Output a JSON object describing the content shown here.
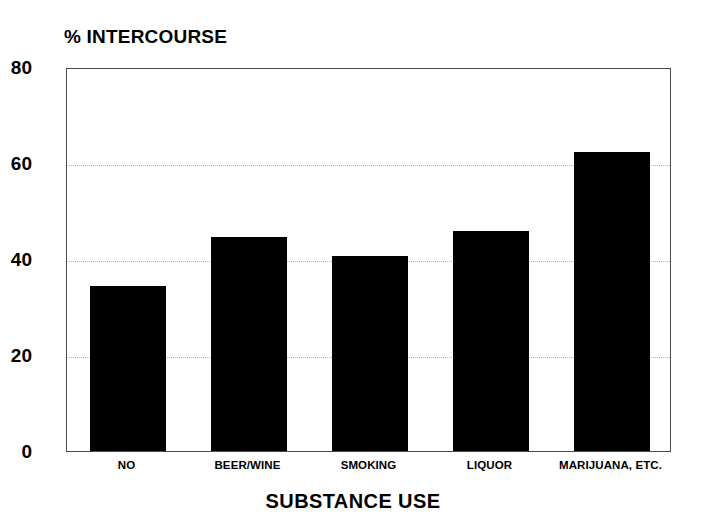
{
  "chart_data": {
    "type": "bar",
    "title": "",
    "ylabel": "% INTERCOURSE",
    "xlabel": "SUBSTANCE USE",
    "categories": [
      "NO",
      "BEER/WINE",
      "SMOKING",
      "LIQUOR",
      "MARIJUANA, ETC."
    ],
    "values": [
      34.4,
      44.6,
      40.7,
      45.8,
      62.2
    ],
    "ylim": [
      0,
      80
    ],
    "yticks": [
      0,
      20,
      40,
      60,
      80
    ],
    "ytick_labels": [
      "0",
      "20",
      "40",
      "60",
      "80"
    ],
    "grid": "horizontal-dotted",
    "gridlines_at": [
      20,
      40,
      60
    ],
    "legend": "none",
    "bar_color": "#000000",
    "axis_color": "#4a4a4a",
    "grid_color": "#b4b4b4",
    "background_color": "#ffffff"
  }
}
